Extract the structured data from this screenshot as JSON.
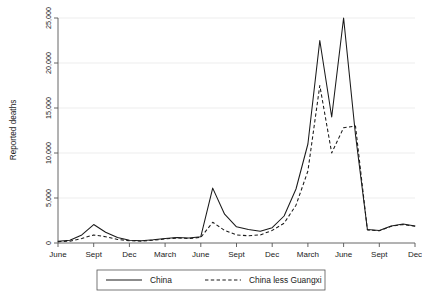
{
  "chart_data": {
    "type": "line",
    "title": "",
    "xlabel": "",
    "ylabel": "Reported deaths",
    "ylim": [
      0,
      25000
    ],
    "yticks": [
      0,
      5000,
      10000,
      15000,
      20000,
      25000
    ],
    "ytick_labels": [
      "0",
      "5,000",
      "10,000",
      "15,000",
      "20,000",
      "25,000"
    ],
    "grid": true,
    "grid_axis": "y",
    "legend_position": "bottom-center",
    "xtick_labels": [
      "June",
      "Sept",
      "Dec",
      "March",
      "June",
      "Sept",
      "Dec",
      "March",
      "June",
      "Sept",
      "Dec"
    ],
    "x": [
      "June",
      "July",
      "Aug",
      "Sept",
      "Oct",
      "Nov",
      "Dec",
      "Jan",
      "Feb",
      "March",
      "April",
      "May",
      "June",
      "July",
      "Aug",
      "Sept",
      "Oct",
      "Nov",
      "Dec",
      "Jan",
      "Feb",
      "March",
      "April",
      "May",
      "June",
      "July",
      "Aug",
      "Sept",
      "Oct",
      "Nov",
      "Dec"
    ],
    "series": [
      {
        "name": "China",
        "style": "solid",
        "values": [
          200,
          300,
          900,
          2050,
          1200,
          600,
          300,
          250,
          350,
          500,
          600,
          550,
          700,
          6100,
          3200,
          1800,
          1500,
          1300,
          1700,
          3000,
          6000,
          11000,
          22500,
          14000,
          25000,
          12000,
          1500,
          1400,
          1900,
          2100,
          1900
        ]
      },
      {
        "name": "China less Guangxi",
        "style": "dashed",
        "values": [
          150,
          200,
          500,
          900,
          700,
          400,
          250,
          200,
          300,
          450,
          550,
          500,
          620,
          2300,
          1400,
          900,
          800,
          900,
          1400,
          2200,
          4200,
          8000,
          17500,
          10000,
          12800,
          13000,
          1450,
          1350,
          1850,
          2050,
          1850
        ]
      }
    ]
  },
  "legend": {
    "entries": [
      {
        "label": "China",
        "style": "solid"
      },
      {
        "label": "China less Guangxi",
        "style": "dashed"
      }
    ]
  }
}
